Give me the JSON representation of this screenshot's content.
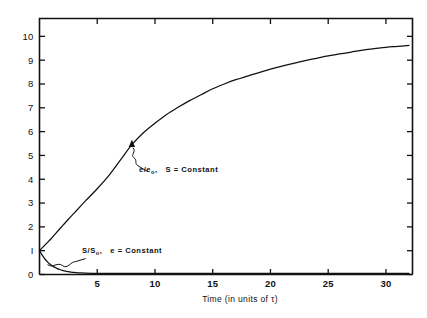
{
  "chart_data": {
    "type": "line",
    "title": "",
    "xlabel": "Time (in units of τ)",
    "ylabel": "",
    "xlim": [
      0,
      32.3
    ],
    "ylim": [
      0,
      10.75
    ],
    "grid": false,
    "legend_position": "inline-annotations",
    "xticks": [
      5,
      10,
      15,
      20,
      25,
      30
    ],
    "xtick_labels": [
      "5",
      "10",
      "15",
      "20",
      "25",
      "30"
    ],
    "yticks": [
      0,
      1,
      2,
      3,
      4,
      5,
      6,
      7,
      8,
      9,
      10
    ],
    "ytick_labels": [
      "0",
      "I",
      "2",
      "3",
      "4",
      "5",
      "6",
      "7",
      "8",
      "9",
      "10"
    ],
    "series": [
      {
        "name": "e/e0",
        "label_main": "e/e",
        "label_sub": "o",
        "label_tail": ",",
        "condition": "S = Constant",
        "x": [
          0,
          0.5,
          1,
          1.5,
          2,
          2.5,
          3,
          3.5,
          4,
          5,
          6,
          7,
          8,
          9,
          10,
          11,
          12,
          13,
          14,
          15,
          16,
          17,
          18,
          19,
          20,
          21,
          22,
          23,
          24,
          25,
          26,
          27,
          28,
          29,
          30,
          31,
          32
        ],
        "values": [
          1.0,
          1.25,
          1.5,
          1.78,
          2.05,
          2.32,
          2.58,
          2.84,
          3.1,
          3.6,
          4.15,
          4.8,
          5.45,
          5.95,
          6.35,
          6.72,
          7.02,
          7.3,
          7.55,
          7.8,
          8.0,
          8.18,
          8.33,
          8.48,
          8.62,
          8.75,
          8.87,
          8.98,
          9.08,
          9.18,
          9.26,
          9.34,
          9.42,
          9.48,
          9.54,
          9.58,
          9.62
        ]
      },
      {
        "name": "S/S0",
        "label_main": "S/S",
        "label_sub": "o",
        "label_tail": ",",
        "condition": "e = Constant",
        "x": [
          0,
          0.25,
          0.5,
          0.75,
          1,
          1.25,
          1.5,
          1.75,
          2,
          2.25,
          2.5,
          3,
          3.5,
          4,
          5,
          6,
          8,
          10,
          14,
          18,
          22,
          26,
          30,
          32
        ],
        "values": [
          1.0,
          0.8,
          0.63,
          0.5,
          0.4,
          0.32,
          0.26,
          0.21,
          0.17,
          0.14,
          0.12,
          0.085,
          0.07,
          0.06,
          0.05,
          0.05,
          0.05,
          0.05,
          0.05,
          0.05,
          0.05,
          0.05,
          0.05,
          0.05
        ]
      }
    ],
    "annotations": [
      {
        "id": "e-over-e0",
        "text": "e/e₀,  S = Constant",
        "points_to_x": 8.0,
        "points_to_y": 5.45
      },
      {
        "id": "s-over-s0",
        "text": "S/S₀,  e = Constant",
        "points_to_x": 0.7,
        "points_to_y": 0.5
      }
    ],
    "colors": {
      "curve": "#111111",
      "axis": "#111111",
      "background": "#ffffff"
    }
  }
}
